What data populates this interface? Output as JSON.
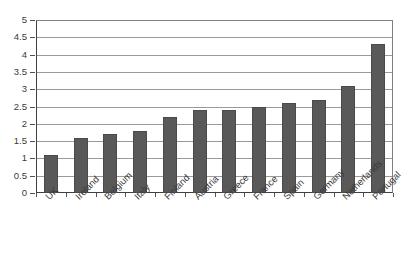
{
  "chart_data": {
    "type": "bar",
    "title": "",
    "subtitle": "",
    "xlabel": "",
    "ylabel": "",
    "categories": [
      "UK",
      "Ireland",
      "Belgium",
      "Italy",
      "Finland",
      "Austria",
      "Greece",
      "France",
      "Spain",
      "Germany",
      "Netherlands",
      "Portugal"
    ],
    "values": [
      1.1,
      1.6,
      1.7,
      1.8,
      2.2,
      2.4,
      2.4,
      2.5,
      2.6,
      2.7,
      3.1,
      4.3
    ],
    "series": [
      {
        "name": "",
        "values": [
          1.1,
          1.6,
          1.7,
          1.8,
          2.2,
          2.4,
          2.4,
          2.5,
          2.6,
          2.7,
          3.1,
          4.3
        ]
      }
    ],
    "ylim": [
      0,
      5
    ],
    "ytick_labels": [
      "0",
      "0.5",
      "1",
      "1.5",
      "2",
      "2.5",
      "3",
      "3.5",
      "4",
      "4.5",
      "5"
    ],
    "ytick_values": [
      0,
      0.5,
      1,
      1.5,
      2,
      2.5,
      3,
      3.5,
      4,
      4.5,
      5
    ],
    "grid": true,
    "grid_axis": "y",
    "legend": false,
    "legend_position": "none",
    "annotations": [],
    "colors": {
      "bar_fill": "#595959",
      "bar_border": "#4a4a4a",
      "gridline": "#9a9a9a",
      "axis": "#404040",
      "plot_background": "#ffffff",
      "text": "#3a3a3a"
    },
    "xtick_label_rotation": -45
  }
}
